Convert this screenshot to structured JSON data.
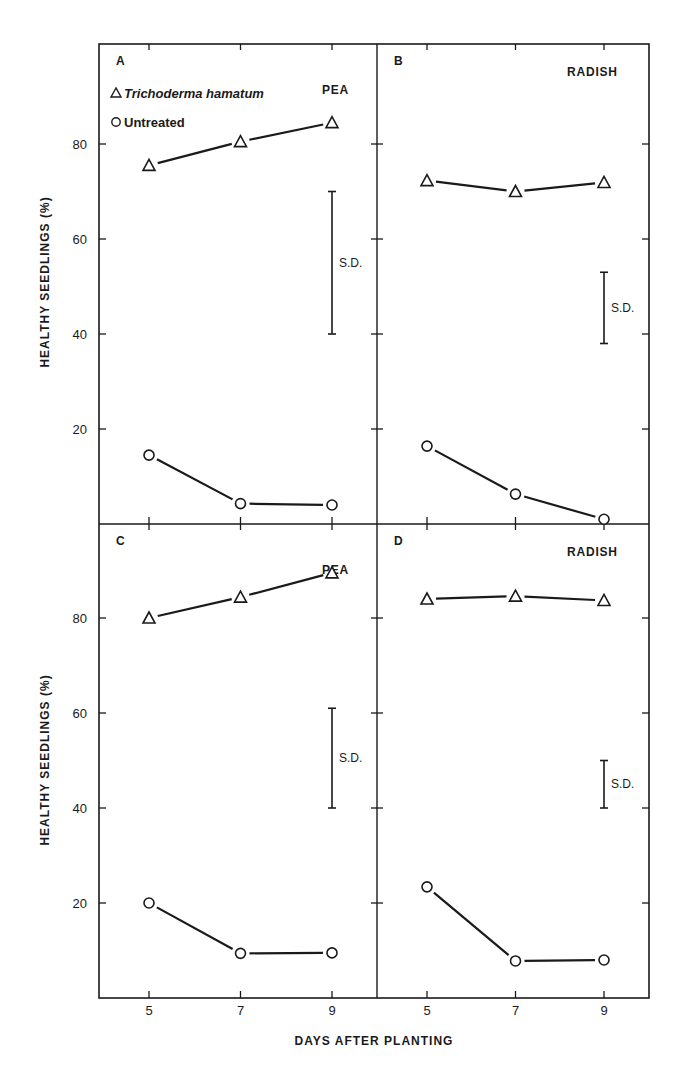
{
  "chart_data": {
    "type": "line",
    "xlabel": "DAYS AFTER PLANTING",
    "ylabel": "HEALTHY SEEDLINGS (%)",
    "x_ticks": [
      5,
      7,
      9
    ],
    "y_ticks": [
      20,
      40,
      60,
      80
    ],
    "ylim": [
      0,
      100
    ],
    "xlim": [
      4,
      10
    ],
    "legend": [
      {
        "marker": "triangle",
        "label": "Trichoderma hamatum",
        "italic": true
      },
      {
        "marker": "circle",
        "label": "Untreated",
        "italic": false
      }
    ],
    "sd_label": "S.D.",
    "panels": [
      {
        "id": "A",
        "crop": "PEA",
        "x": [
          5,
          7,
          9
        ],
        "series": [
          {
            "name": "Trichoderma hamatum",
            "marker": "triangle",
            "values": [
              75.5,
              80.5,
              84.5
            ]
          },
          {
            "name": "Untreated",
            "marker": "circle",
            "values": [
              14.5,
              4.3,
              4.0
            ]
          }
        ],
        "sd_bar": {
          "x": 9,
          "low": 40,
          "high": 70
        }
      },
      {
        "id": "B",
        "crop": "RADISH",
        "x": [
          5,
          7,
          9
        ],
        "series": [
          {
            "name": "Trichoderma hamatum",
            "marker": "triangle",
            "values": [
              72.3,
              70.0,
              71.9
            ]
          },
          {
            "name": "Untreated",
            "marker": "circle",
            "values": [
              16.4,
              6.3,
              1.0
            ]
          }
        ],
        "sd_bar": {
          "x": 9,
          "low": 38,
          "high": 53
        }
      },
      {
        "id": "C",
        "crop": "PEA",
        "x": [
          5,
          7,
          9
        ],
        "series": [
          {
            "name": "Trichoderma hamatum",
            "marker": "triangle",
            "values": [
              80.0,
              84.4,
              89.5
            ]
          },
          {
            "name": "Untreated",
            "marker": "circle",
            "values": [
              20.0,
              9.4,
              9.5
            ]
          }
        ],
        "sd_bar": {
          "x": 9,
          "low": 40,
          "high": 61
        }
      },
      {
        "id": "D",
        "crop": "RADISH",
        "x": [
          5,
          7,
          9
        ],
        "series": [
          {
            "name": "Trichoderma hamatum",
            "marker": "triangle",
            "values": [
              84.0,
              84.6,
              83.7
            ]
          },
          {
            "name": "Untreated",
            "marker": "circle",
            "values": [
              23.4,
              7.8,
              8.0
            ]
          }
        ],
        "sd_bar": {
          "x": 9,
          "low": 40,
          "high": 50
        }
      }
    ]
  }
}
